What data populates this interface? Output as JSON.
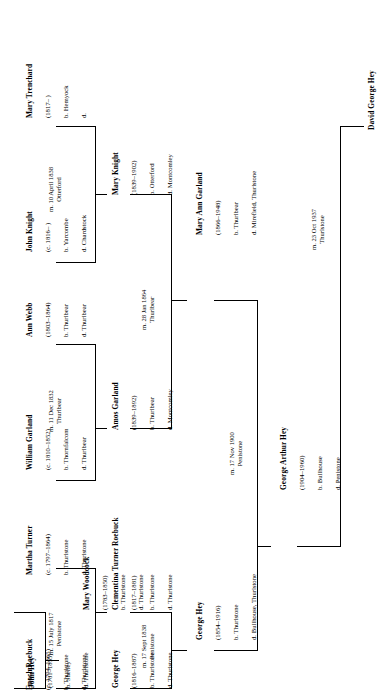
{
  "orientation": "text rotated 90 degrees counter-clockwise",
  "people": {
    "mary_trenchard": {
      "name": "Mary Trenchard",
      "dates": "(1817–    )",
      "born": "b. Hemyock",
      "died": "d."
    },
    "john_knight": {
      "name": "John Knight",
      "dates": "(c. 1816–    )",
      "born": "b. Yarcombe",
      "died": "d. Chardstock"
    },
    "ann_webb": {
      "name": "Ann Webb",
      "dates": "(1803–1864)",
      "born": "b. Thurlbear",
      "died": "d. Thurlbear"
    },
    "william_garland": {
      "name": "William Garland",
      "dates": "(c. 1810–1852)",
      "born": "b. Thornfalcom",
      "died": "d. Thurlbear"
    },
    "martha_turner": {
      "name": "Martha Turner",
      "dates": "(c. 1797–1864)",
      "born": "b. Thurlstone",
      "died": "d. Thurlstone"
    },
    "enoch_roebuck": {
      "name": "Enoch Roebuck",
      "dates": "(c. 1794–1865)",
      "born": "b. Thurlstone",
      "died": "d. Thurlstone"
    },
    "mary_woodcock": {
      "name": "Mary Woodcock",
      "dates": "(1783–1850)",
      "born": "b. Thurlstone",
      "died": "d. Thurlstone"
    },
    "john_hey": {
      "name": "John Hey",
      "dates": "(1781–1855)",
      "born": "b. Shelley",
      "died": "d. Thurlstone"
    },
    "mary_knight": {
      "name": "Mary Knight",
      "dates": "(1839–1902)",
      "born": "b. Otterford",
      "died": "d. Montcomley"
    },
    "amos_garland": {
      "name": "Amos Garland",
      "dates": "(1839–1892)",
      "born": "b. Thurlbear",
      "died": "d. Montcomley"
    },
    "clementina": {
      "name": "Clementina Turner Roebuck",
      "dates": "(1817–1881)",
      "born": "b. Thurlstone",
      "died": "d. Thurlstone"
    },
    "george_hey_1816": {
      "name": "George Hey",
      "dates": "(1816–1887)",
      "born": "b. Thurlstone",
      "died": "d. Thurlstone"
    },
    "mary_ann_garland": {
      "name": "Mary Ann Garland",
      "dates": "(1866–1948)",
      "born": "b. Thurlbear",
      "died": "d. Mirefield, Thurlstone"
    },
    "george_hey_1854": {
      "name": "George Hey",
      "dates": "(1854–1916)",
      "born": "b. Thurlstone",
      "died": "d. Bullhouse, Thurlstone"
    },
    "george_arthur_hey": {
      "name": "George Arthur Hey",
      "dates": "(1904–1960)",
      "born": "b. Bullhouse",
      "died": "d. Penistone"
    },
    "david_george_hey": {
      "name": "David George Hey",
      "dates": "",
      "born": "",
      "died": ""
    }
  },
  "marriages": {
    "knight_trenchard": {
      "line1": "m. 10 April 1838",
      "line2": "Otterford"
    },
    "garland_webb": {
      "line1": "m. 11 Dec 1832",
      "line2": "Thurlbear"
    },
    "roebuck_turner": {
      "line1": "m. 15 July 1817",
      "line2": "Penistone"
    },
    "hey_woodcock": {
      "line1": "m. 15 Dec 1806",
      "line2": "Penistone"
    },
    "garland_knight": {
      "line1": "m. 28 Jan 1864",
      "line2": "Thurlbear"
    },
    "hey_roebuck": {
      "line1": "m. 17 Sept 1838",
      "line2": "Penistone"
    },
    "hey_garland": {
      "line1": "m. 17 Nov 1900",
      "line2": "Penistone"
    },
    "arthur_hey_spouse": {
      "line1": "m. 23 Oct 1937",
      "line2": "Thurlstone"
    }
  }
}
